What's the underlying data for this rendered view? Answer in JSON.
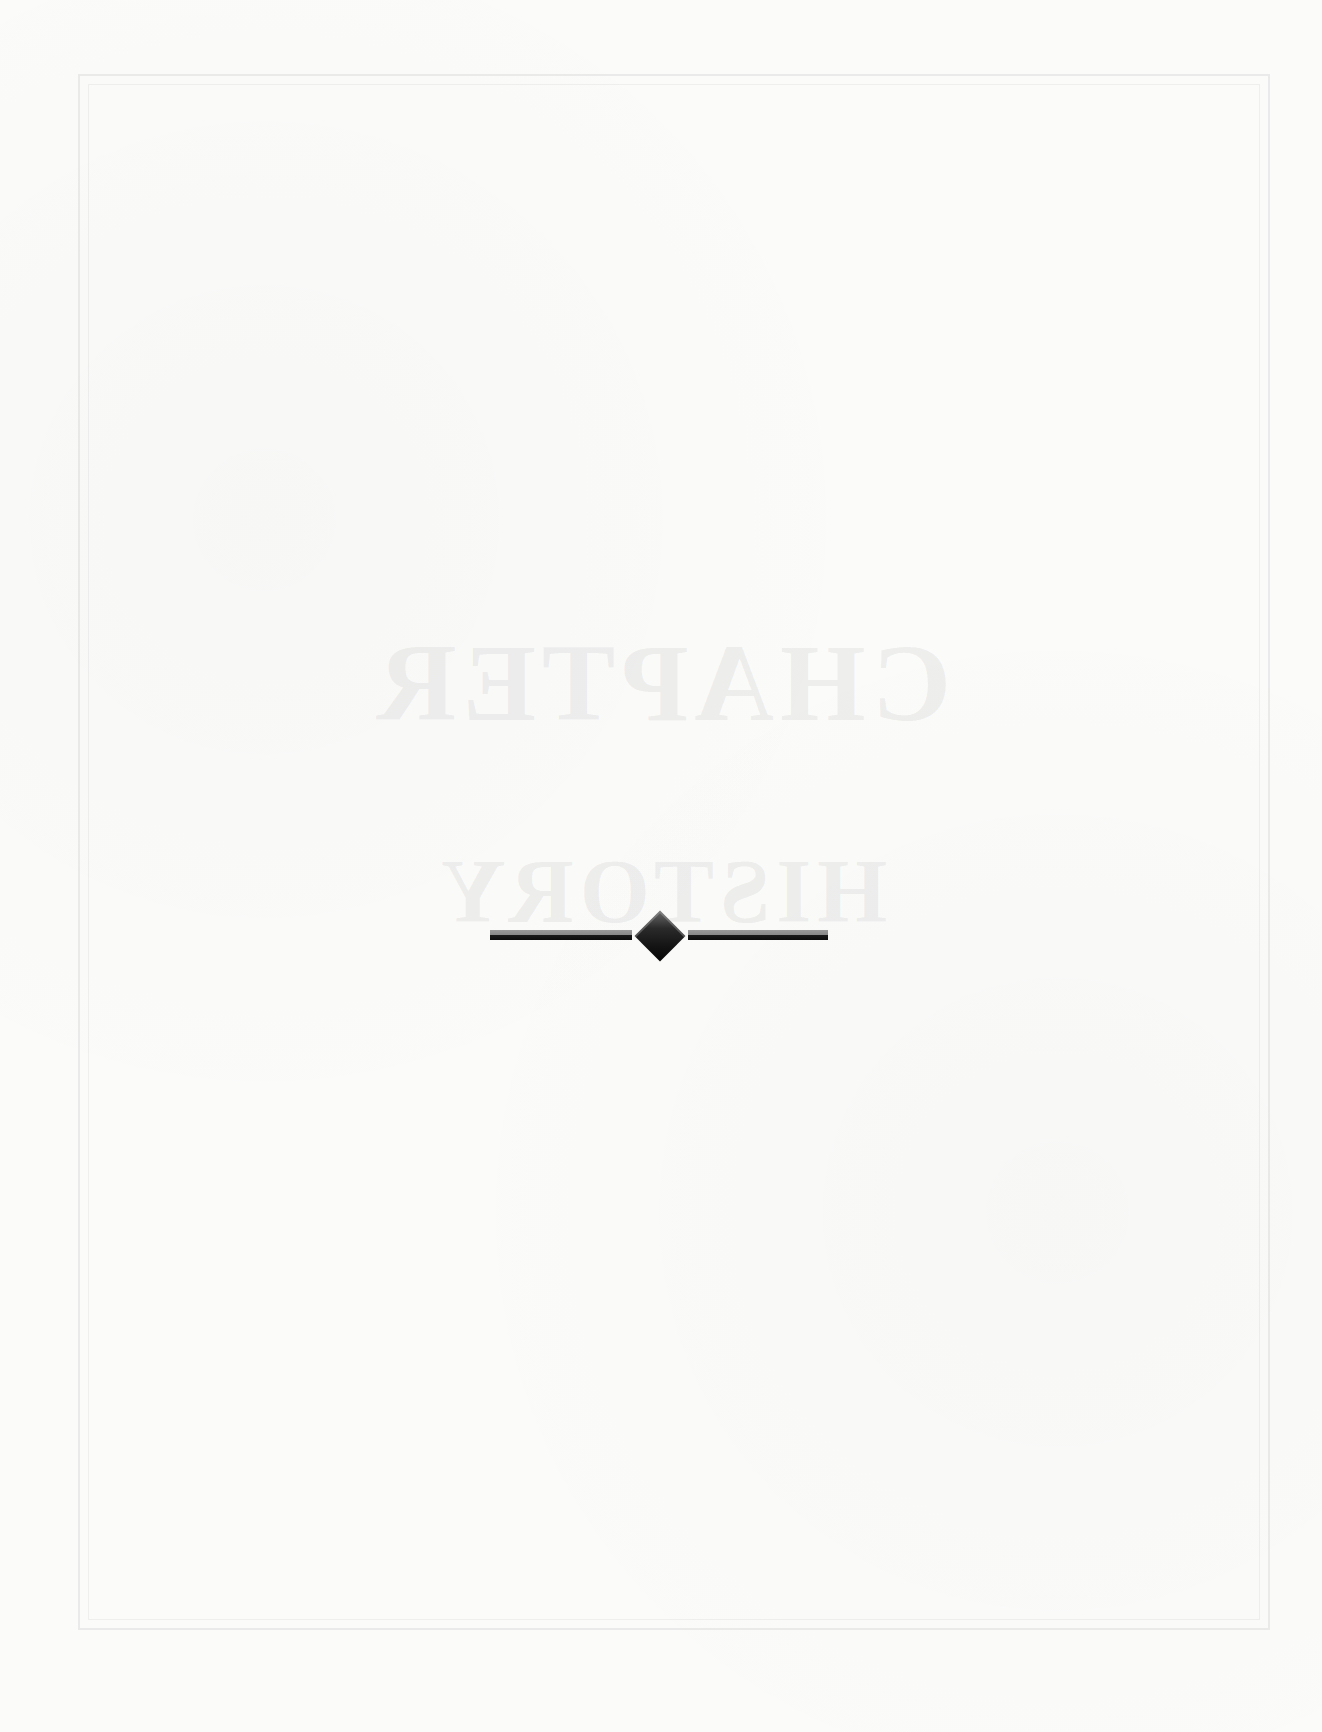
{
  "page": {
    "background_color": "#fbfbfa",
    "frame_color": "#a0a0a0",
    "ghost_text": {
      "line1": "CHAPTER",
      "line2": "HISTORY"
    },
    "ornament": {
      "type": "divider-bar-diamond-bar",
      "color": "#111111"
    },
    "page_number": ""
  }
}
